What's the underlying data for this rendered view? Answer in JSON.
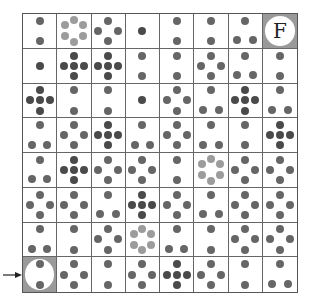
{
  "board": {
    "rows": 8,
    "cols": 8,
    "colors": {
      "grid_line": "#666666",
      "special_bg": "#9a9a9a",
      "dot_dark": "#4a4a4a",
      "dot_mid": "#666666",
      "dot_light": "#9c9c9c"
    },
    "cells": [
      [
        "2",
        "6",
        "4",
        "1",
        "2",
        "2",
        "3",
        "F"
      ],
      [
        "1",
        "5",
        "5",
        "2",
        "2",
        "4",
        "3",
        "2"
      ],
      [
        "5",
        "2",
        "2",
        "1",
        "4",
        "3",
        "5",
        "3"
      ],
      [
        "3",
        "4",
        "5",
        "3",
        "4",
        "3",
        "2",
        "5"
      ],
      [
        "3",
        "5",
        "4",
        "4",
        "2",
        "6",
        "4",
        "4"
      ],
      [
        "4",
        "4",
        "3",
        "5",
        "4",
        "3",
        "4",
        "4"
      ],
      [
        "3",
        "2",
        "4",
        "6",
        "3",
        "2",
        "4",
        "4"
      ],
      [
        "2",
        "4",
        "2",
        "4",
        "5",
        "4",
        "2",
        "3"
      ]
    ],
    "start": {
      "row": 7,
      "col": 0
    },
    "finish": {
      "row": 0,
      "col": 7,
      "label": "F"
    }
  },
  "arrow": {
    "icon": "right-arrow-icon",
    "points_to": "start-cell"
  }
}
